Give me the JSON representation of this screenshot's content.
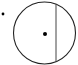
{
  "diagram": {
    "type": "geometry",
    "colors": {
      "stroke": "#222222",
      "background": "#ffffff"
    },
    "circle": {
      "cx": 44.5,
      "cy": 33,
      "r": 31
    },
    "center_point": {
      "x": 45,
      "y": 34
    },
    "external_point": {
      "x": 3,
      "y": 14
    },
    "chord": {
      "x": 56,
      "y1": 3.5,
      "y2": 62.5
    }
  }
}
